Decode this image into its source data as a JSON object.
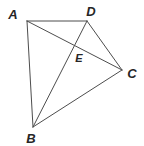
{
  "figure": {
    "background_color": "#ffffff",
    "line_color": "#4d4d4d",
    "label_color": "#262626",
    "stroke_width": 1,
    "canvas": {
      "width": 144,
      "height": 146
    },
    "points": [
      {
        "id": "A",
        "label": "A",
        "x": 27,
        "y": 21,
        "label_x": 13,
        "label_y": 14,
        "size": "normal"
      },
      {
        "id": "D",
        "label": "D",
        "x": 87,
        "y": 21,
        "label_x": 91,
        "label_y": 11,
        "size": "normal"
      },
      {
        "id": "C",
        "label": "C",
        "x": 122,
        "y": 70,
        "label_x": 132,
        "label_y": 73,
        "size": "normal"
      },
      {
        "id": "B",
        "label": "B",
        "x": 33,
        "y": 127,
        "label_x": 31,
        "label_y": 138,
        "size": "normal"
      },
      {
        "id": "E",
        "label": "E",
        "x": 75,
        "y": 47,
        "label_x": 79,
        "label_y": 58,
        "size": "small"
      }
    ],
    "segments": [
      {
        "id": "AD",
        "from": "A",
        "to": "D",
        "x1": 27,
        "y1": 21,
        "x2": 87,
        "y2": 21
      },
      {
        "id": "DC",
        "from": "D",
        "to": "C",
        "x1": 87,
        "y1": 21,
        "x2": 122,
        "y2": 70
      },
      {
        "id": "CB",
        "from": "C",
        "to": "B",
        "x1": 122,
        "y1": 70,
        "x2": 33,
        "y2": 127
      },
      {
        "id": "BA",
        "from": "B",
        "to": "A",
        "x1": 33,
        "y1": 127,
        "x2": 27,
        "y2": 21
      },
      {
        "id": "AC",
        "from": "A",
        "to": "C",
        "x1": 27,
        "y1": 21,
        "x2": 122,
        "y2": 70
      },
      {
        "id": "BD",
        "from": "B",
        "to": "D",
        "x1": 33,
        "y1": 127,
        "x2": 87,
        "y2": 21
      }
    ]
  }
}
